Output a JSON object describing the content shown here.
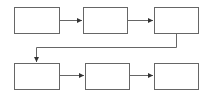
{
  "diagram": {
    "type": "flowchart",
    "colors": {
      "stroke": "#666666",
      "fill": "#ffffff",
      "background": "#ffffff"
    },
    "nodes": [
      {
        "id": "box-1",
        "label": "",
        "x": 14,
        "y": 7,
        "w": 45,
        "h": 26
      },
      {
        "id": "box-2",
        "label": "",
        "x": 83,
        "y": 7,
        "w": 44,
        "h": 26
      },
      {
        "id": "box-3",
        "label": "",
        "x": 154,
        "y": 7,
        "w": 44,
        "h": 26
      },
      {
        "id": "box-4",
        "label": "",
        "x": 14,
        "y": 63,
        "w": 45,
        "h": 26
      },
      {
        "id": "box-5",
        "label": "",
        "x": 85,
        "y": 63,
        "w": 44,
        "h": 26
      },
      {
        "id": "box-6",
        "label": "",
        "x": 154,
        "y": 63,
        "w": 44,
        "h": 26
      }
    ],
    "edges": [
      {
        "from": "box-1",
        "to": "box-2"
      },
      {
        "from": "box-2",
        "to": "box-3"
      },
      {
        "from": "box-3",
        "to": "box-4"
      },
      {
        "from": "box-4",
        "to": "box-5"
      },
      {
        "from": "box-5",
        "to": "box-6"
      }
    ]
  }
}
